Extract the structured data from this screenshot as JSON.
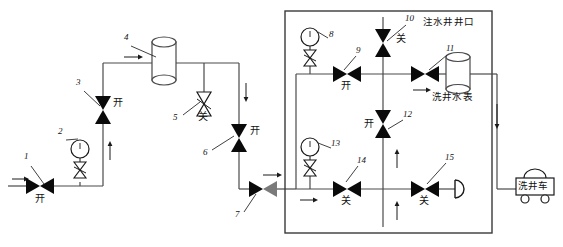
{
  "diagram": {
    "title_text": "注水井井口",
    "meter_label": "洗井水表",
    "truck_label": "洗井车",
    "state_open": "开",
    "state_closed": "关"
  },
  "components": [
    {
      "id": "1",
      "kind": "gate-valve-horizontal",
      "state": "开",
      "x": 40,
      "y": 186
    },
    {
      "id": "2",
      "kind": "pressure-gauge",
      "state": "",
      "x": 80,
      "y": 168
    },
    {
      "id": "3",
      "kind": "gate-valve-vertical",
      "state": "开",
      "x": 103,
      "y": 110
    },
    {
      "id": "4",
      "kind": "tank-cylinder",
      "state": "",
      "x": 163,
      "y": 70
    },
    {
      "id": "5",
      "kind": "gate-valve-vertical-open-symbol",
      "state": "关",
      "x": 204,
      "y": 104
    },
    {
      "id": "6",
      "kind": "gate-valve-vertical",
      "state": "开",
      "x": 239,
      "y": 138
    },
    {
      "id": "7",
      "kind": "gate-valve-horizontal",
      "state": "",
      "x": 263,
      "y": 189
    },
    {
      "id": "8",
      "kind": "pressure-gauge",
      "state": "",
      "x": 310,
      "y": 48
    },
    {
      "id": "9",
      "kind": "gate-valve-horizontal",
      "state": "开",
      "x": 347,
      "y": 74
    },
    {
      "id": "10",
      "kind": "gate-valve-vertical",
      "state": "关",
      "x": 383,
      "y": 43
    },
    {
      "id": "11",
      "kind": "gate-valve-horizontal",
      "state": "",
      "x": 425,
      "y": 74
    },
    {
      "id": "12",
      "kind": "gate-valve-vertical",
      "state": "开",
      "x": 383,
      "y": 124
    },
    {
      "id": "13",
      "kind": "pressure-gauge",
      "state": "",
      "x": 310,
      "y": 158
    },
    {
      "id": "14",
      "kind": "gate-valve-horizontal",
      "state": "关",
      "x": 347,
      "y": 184
    },
    {
      "id": "15",
      "kind": "gate-valve-horizontal",
      "state": "关",
      "x": 425,
      "y": 184
    }
  ],
  "callouts": [
    {
      "label": "1",
      "x": 27,
      "y": 158
    },
    {
      "label": "2",
      "x": 60,
      "y": 133
    },
    {
      "label": "3",
      "x": 79,
      "y": 84
    },
    {
      "label": "4",
      "x": 126,
      "y": 39
    },
    {
      "label": "5",
      "x": 176,
      "y": 118
    },
    {
      "label": "6",
      "x": 205,
      "y": 153
    },
    {
      "label": "7",
      "x": 236,
      "y": 215
    },
    {
      "label": "8",
      "x": 329,
      "y": 32
    },
    {
      "label": "9",
      "x": 357,
      "y": 48
    },
    {
      "label": "10",
      "x": 408,
      "y": 17
    },
    {
      "label": "11",
      "x": 448,
      "y": 47
    },
    {
      "label": "12",
      "x": 404,
      "y": 113
    },
    {
      "label": "13",
      "x": 332,
      "y": 142
    },
    {
      "label": "14",
      "x": 359,
      "y": 158
    },
    {
      "label": "15",
      "x": 447,
      "y": 155
    }
  ],
  "state_labels": [
    {
      "text": "开",
      "x": 37,
      "y": 199
    },
    {
      "text": "开",
      "x": 112,
      "y": 103
    },
    {
      "text": "关",
      "x": 198,
      "y": 116
    },
    {
      "text": "开",
      "x": 250,
      "y": 131
    },
    {
      "text": "开",
      "x": 341,
      "y": 86
    },
    {
      "text": "关",
      "x": 396,
      "y": 39
    },
    {
      "text": "开",
      "x": 366,
      "y": 118
    },
    {
      "text": "关",
      "x": 341,
      "y": 196
    },
    {
      "text": "关",
      "x": 420,
      "y": 196
    }
  ],
  "colors": {
    "line": "#4a4a4a",
    "valve_fill": "#0a0a0a",
    "valve_fill_gray": "#7a7a7a",
    "box_border": "#3a3a3a",
    "background": "#ffffff"
  }
}
